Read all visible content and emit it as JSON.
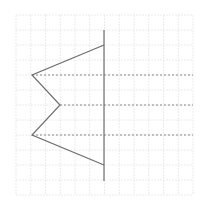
{
  "diagram": {
    "title": "Reflection of a polyline across a vertical axis on a grid",
    "grid": {
      "x0": 16,
      "y0": 15,
      "x1": 193,
      "y1": 195,
      "cols": 12,
      "rows": 12,
      "color": "#e6e6e6"
    },
    "axis": {
      "x": 104,
      "y_start": 30,
      "y_end": 181,
      "color": "#6e6e6e"
    },
    "polyline": {
      "points": [
        [
          104,
          45
        ],
        [
          32,
          75
        ],
        [
          60,
          105
        ],
        [
          32,
          135
        ],
        [
          104,
          165
        ]
      ],
      "color": "#6e6e6e"
    },
    "dashed_lines": [
      {
        "y": 75,
        "x_start": 32,
        "x_end": 193
      },
      {
        "y": 105,
        "x_start": 60,
        "x_end": 193
      },
      {
        "y": 135,
        "x_start": 32,
        "x_end": 193
      }
    ],
    "dashed_color": "#8a8a8a"
  }
}
